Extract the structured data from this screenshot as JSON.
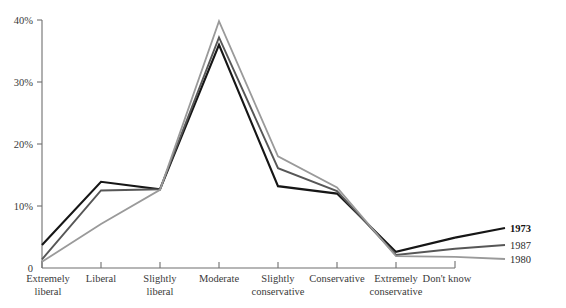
{
  "chart_data": {
    "type": "line",
    "title": "",
    "subtitle": "",
    "xlabel": "",
    "ylabel": "",
    "categories": [
      "Extremely liberal",
      "Liberal",
      "Slightly liberal",
      "Moderate",
      "Slightly conservative",
      "Conservative",
      "Extremely conservative",
      "Don't know"
    ],
    "category_lines": [
      [
        "Extremely",
        "liberal"
      ],
      [
        "Liberal"
      ],
      [
        "Slightly",
        "liberal"
      ],
      [
        "Moderate"
      ],
      [
        "Slightly",
        "conservative"
      ],
      [
        "Conservative"
      ],
      [
        "Extremely",
        "conservative"
      ],
      [
        "Don't know"
      ]
    ],
    "ylim": [
      0,
      40
    ],
    "yticks": [
      0,
      10,
      20,
      30,
      40
    ],
    "ytick_labels": [
      "0",
      "10%",
      "20%",
      "30%",
      "40%"
    ],
    "grid": false,
    "legend_position": "right",
    "series": [
      {
        "name": "1973",
        "color": "#161616",
        "width": 2.1,
        "values": [
          3.7,
          13.9,
          12.7,
          36.0,
          13.2,
          12.0,
          2.6,
          4.9
        ]
      },
      {
        "name": "1987",
        "color": "#575757",
        "width": 1.9,
        "values": [
          1.4,
          12.5,
          12.7,
          37.2,
          16.1,
          12.4,
          2.1,
          3.1
        ]
      },
      {
        "name": "1980",
        "color": "#9a9a9a",
        "width": 1.8,
        "values": [
          1.0,
          7.1,
          12.6,
          39.8,
          18.0,
          13.0,
          1.9,
          1.8
        ]
      }
    ]
  },
  "axis": {
    "y_tick_labels": [
      "40%",
      "30%",
      "20%",
      "10%",
      "0"
    ],
    "legend_items": [
      "1973",
      "1987",
      "1980"
    ]
  }
}
